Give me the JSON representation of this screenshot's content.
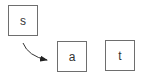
{
  "diagram": {
    "nodes": [
      {
        "id": "s",
        "label": "s"
      },
      {
        "id": "a",
        "label": "a"
      },
      {
        "id": "t",
        "label": "t"
      }
    ],
    "edges": [
      {
        "from": "s",
        "to": "a",
        "style": "curved-arrow"
      }
    ],
    "colors": {
      "border": "#6e6e6e",
      "arrow": "#222222",
      "text": "#333333"
    }
  }
}
